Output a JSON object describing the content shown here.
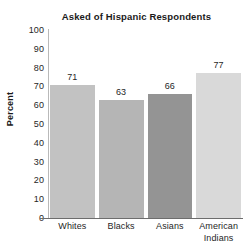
{
  "chart_data": {
    "type": "bar",
    "title": "Asked of Hispanic Respondents",
    "xlabel": "",
    "ylabel": "Percent",
    "categories": [
      "Whites",
      "Blacks",
      "Asians",
      "American Indians"
    ],
    "values": [
      71,
      63,
      66,
      77
    ],
    "value_labels": [
      "71",
      "63",
      "66",
      "77"
    ],
    "ylim": [
      0,
      100
    ],
    "yticks": [
      100,
      90,
      80,
      70,
      60,
      50,
      40,
      30,
      20,
      10,
      0
    ],
    "ytick_labels": [
      "100",
      "90",
      "80",
      "70",
      "60",
      "50",
      "40",
      "30",
      "20",
      "10",
      "0"
    ],
    "grid": false,
    "legend": "none",
    "bar_colors": [
      "#c2c2c2",
      "#b5b5b5",
      "#949494",
      "#d9d9d9"
    ],
    "category_label_lines": [
      [
        "Whites"
      ],
      [
        "Blacks"
      ],
      [
        "Asians"
      ],
      [
        "American",
        "Indians"
      ]
    ]
  },
  "style": {
    "background": "#ffffff",
    "axis_color": "#6d6d6d",
    "y_axis_color": "#b9b9b9",
    "text_color": "#262626",
    "title_color": "#1a1a1a"
  }
}
